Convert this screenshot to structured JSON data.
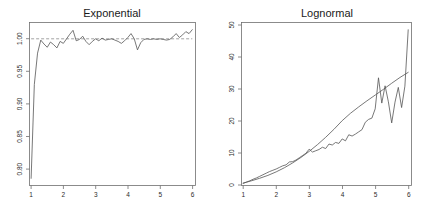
{
  "figure": {
    "background_color": "#ffffff",
    "panel_count": 2,
    "layout": "1x2"
  },
  "chart_data": [
    {
      "type": "line",
      "title": "Exponential",
      "xlabel": "",
      "ylabel": "",
      "xlim": [
        0.95,
        6.1
      ],
      "ylim": [
        0.775,
        1.025
      ],
      "grid": false,
      "legend": "none",
      "xticks": [
        1,
        2,
        3,
        4,
        5,
        6
      ],
      "xtick_labels": [
        "1",
        "2",
        "3",
        "4",
        "5",
        "6"
      ],
      "yticks": [
        0.8,
        0.85,
        0.9,
        0.95,
        1.0
      ],
      "ytick_labels": [
        "0.80",
        "0.85",
        "0.90",
        "0.95",
        "1.00"
      ],
      "ytick_rotation": 90,
      "series": [
        {
          "name": "reference",
          "style": "dashed-horizontal",
          "color": "#8a8a8a",
          "y_constant": 1.0,
          "x": [
            1.0,
            6.0
          ]
        },
        {
          "name": "empirical-ratio",
          "style": "solid-jagged",
          "color": "#555555",
          "x": [
            1.0,
            1.1,
            1.2,
            1.3,
            1.4,
            1.5,
            1.6,
            1.7,
            1.8,
            1.9,
            2.0,
            2.1,
            2.2,
            2.3,
            2.4,
            2.5,
            2.6,
            2.7,
            2.8,
            2.9,
            3.0,
            3.1,
            3.2,
            3.3,
            3.4,
            3.5,
            3.6,
            3.7,
            3.8,
            3.9,
            4.0,
            4.1,
            4.2,
            4.3,
            4.4,
            4.5,
            4.6,
            4.7,
            4.8,
            4.9,
            5.0,
            5.1,
            5.2,
            5.3,
            5.4,
            5.5,
            5.6,
            5.7,
            5.8,
            5.9,
            6.0
          ],
          "y": [
            0.786,
            0.93,
            0.978,
            0.998,
            0.992,
            0.987,
            0.995,
            0.991,
            0.986,
            0.996,
            0.993,
            1.0,
            1.007,
            1.013,
            0.997,
            0.999,
            1.004,
            0.996,
            0.991,
            0.996,
            1.0,
            0.997,
            1.001,
            0.998,
            0.999,
            1.0,
            0.998,
            0.996,
            0.993,
            0.997,
            1.002,
            1.008,
            1.0,
            0.983,
            0.994,
            0.999,
            1.0,
            0.999,
            1.0,
            0.999,
            1.0,
            0.999,
            0.998,
            0.999,
            1.003,
            1.008,
            1.002,
            1.006,
            1.011,
            1.008,
            1.014
          ]
        }
      ]
    },
    {
      "type": "line",
      "title": "Lognormal",
      "xlabel": "",
      "ylabel": "",
      "xlim": [
        0.95,
        6.1
      ],
      "ylim": [
        0,
        50
      ],
      "grid": false,
      "legend": "none",
      "xticks": [
        1,
        2,
        3,
        4,
        5,
        6
      ],
      "xtick_labels": [
        "1",
        "2",
        "3",
        "4",
        "5",
        "6"
      ],
      "yticks": [
        0,
        10,
        20,
        30,
        40,
        50
      ],
      "ytick_labels": [
        "0",
        "10",
        "20",
        "30",
        "40",
        "50"
      ],
      "ytick_rotation": 90,
      "series": [
        {
          "name": "theoretical-curve",
          "style": "solid-smooth",
          "color": "#555555",
          "x": [
            1.0,
            1.25,
            1.5,
            1.75,
            2.0,
            2.25,
            2.5,
            2.75,
            3.0,
            3.25,
            3.5,
            3.75,
            4.0,
            4.25,
            4.5,
            4.75,
            5.0,
            5.25,
            5.5,
            5.75,
            6.0
          ],
          "y": [
            0.6,
            1.3,
            2.1,
            3.0,
            4.1,
            5.4,
            6.9,
            8.6,
            10.5,
            12.6,
            14.9,
            17.4,
            20.1,
            22.4,
            24.4,
            26.3,
            28.1,
            29.9,
            31.8,
            33.6,
            35.2
          ]
        },
        {
          "name": "empirical-curve",
          "style": "solid-jagged",
          "color": "#555555",
          "x": [
            1.0,
            1.1,
            1.2,
            1.3,
            1.4,
            1.5,
            1.6,
            1.7,
            1.8,
            1.9,
            2.0,
            2.1,
            2.2,
            2.3,
            2.4,
            2.5,
            2.6,
            2.7,
            2.8,
            2.9,
            3.0,
            3.1,
            3.2,
            3.3,
            3.4,
            3.5,
            3.6,
            3.7,
            3.8,
            3.9,
            4.0,
            4.1,
            4.2,
            4.3,
            4.4,
            4.5,
            4.6,
            4.7,
            4.8,
            4.9,
            5.0,
            5.1,
            5.2,
            5.3,
            5.4,
            5.5,
            5.6,
            5.7,
            5.8,
            5.9,
            6.0
          ],
          "y": [
            0.5,
            0.9,
            1.3,
            1.8,
            2.2,
            2.7,
            3.2,
            3.7,
            4.2,
            4.6,
            5.0,
            5.5,
            6.0,
            6.3,
            7.2,
            7.3,
            7.8,
            8.5,
            9.2,
            9.9,
            11.2,
            10.3,
            10.7,
            11.1,
            11.8,
            11.4,
            12.8,
            12.5,
            13.3,
            13.0,
            14.4,
            13.8,
            15.7,
            15.3,
            15.9,
            16.6,
            17.3,
            19.6,
            20.5,
            20.9,
            23.8,
            33.5,
            25.6,
            31.0,
            26.0,
            19.4,
            25.9,
            30.5,
            24.2,
            30.9,
            48.5
          ]
        }
      ]
    }
  ]
}
